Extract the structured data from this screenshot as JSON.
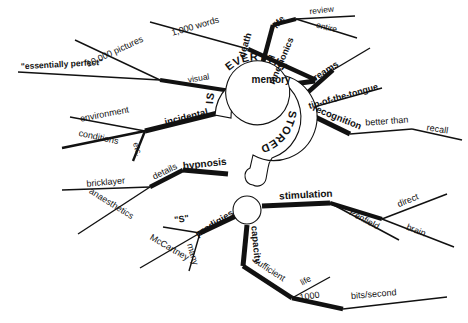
{
  "diagram": {
    "type": "mind-map",
    "title_words": [
      "IS",
      "EVERYTHING",
      "STORED"
    ],
    "center_shape": "question-mark",
    "palette": {
      "background": "#ffffff",
      "ink": "#111111"
    },
    "center": {
      "word_is": "IS",
      "word_everything": "EVERYTHING",
      "word_stored": "STORED"
    },
    "branches": [
      {
        "id": "memory",
        "label": "memory",
        "children": [
          {
            "id": "mnemonics",
            "label": "mnemonics",
            "children": [
              {
                "id": "thousand-words",
                "label": "1,000 words"
              }
            ]
          },
          {
            "id": "visual",
            "label": "visual",
            "children": [
              {
                "id": "ten-thousand-pictures",
                "label": "10,000 pictures"
              },
              {
                "id": "essentially-perfect",
                "label": "\"essentially perfect\""
              }
            ]
          }
        ]
      },
      {
        "id": "death",
        "label": "death",
        "children": [
          {
            "id": "life",
            "label": "life",
            "children": [
              {
                "id": "review",
                "label": "review"
              },
              {
                "id": "entire",
                "label": "entire"
              }
            ]
          }
        ]
      },
      {
        "id": "dreams",
        "label": "dreams",
        "children": []
      },
      {
        "id": "tip-of-the-tongue",
        "label": "tip-of-the-tongue",
        "children": []
      },
      {
        "id": "recognition",
        "label": "recognition",
        "children": [
          {
            "id": "better-than",
            "label": "better than",
            "children": [
              {
                "id": "recall",
                "label": "recall"
              }
            ]
          }
        ]
      },
      {
        "id": "incidental",
        "label": "incidental",
        "children": [
          {
            "id": "environment",
            "label": "environment"
          },
          {
            "id": "conditions",
            "label": "conditions"
          },
          {
            "id": "etc",
            "label": "etc."
          }
        ]
      },
      {
        "id": "hypnosis",
        "label": "hypnosis",
        "children": [
          {
            "id": "details",
            "label": "details",
            "children": [
              {
                "id": "bricklayer",
                "label": "bricklayer"
              },
              {
                "id": "anaesthetics",
                "label": "anaesthetics"
              }
            ]
          }
        ]
      },
      {
        "id": "prodigies",
        "label": "prodigies",
        "children": [
          {
            "id": "s-quoted",
            "label": "\"S\""
          },
          {
            "id": "mccartney",
            "label": "McCartney"
          },
          {
            "id": "many",
            "label": "many"
          }
        ]
      },
      {
        "id": "capacity",
        "label": "capacity",
        "children": [
          {
            "id": "sufficient",
            "label": "sufficient",
            "children": [
              {
                "id": "life-2",
                "label": "life"
              },
              {
                "id": "thousand",
                "label": "1000"
              },
              {
                "id": "bits-per-second",
                "label": "bits/second"
              }
            ]
          }
        ]
      },
      {
        "id": "stimulation",
        "label": "stimulation",
        "children": [
          {
            "id": "penfield",
            "label": "Penfield"
          },
          {
            "id": "direct",
            "label": "direct"
          },
          {
            "id": "brain",
            "label": "brain"
          }
        ]
      }
    ]
  }
}
